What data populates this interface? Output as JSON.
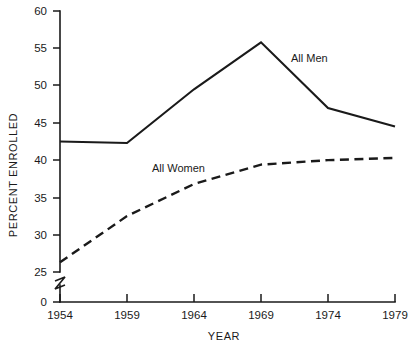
{
  "chart_data": {
    "type": "line",
    "title": "",
    "xlabel": "YEAR",
    "ylabel": "PERCENT ENROLLED",
    "categories": [
      "1954",
      "1959",
      "1964",
      "1969",
      "1974",
      "1979"
    ],
    "x": [
      1954,
      1959,
      1964,
      1969,
      1974,
      1979
    ],
    "xlim": [
      1954,
      1979
    ],
    "ylim": [
      25,
      60
    ],
    "y_axis_break": true,
    "y_axis_break_from": 0,
    "y_axis_break_to": 25,
    "y_ticks": [
      0,
      25,
      30,
      35,
      40,
      45,
      50,
      55,
      60
    ],
    "y_tick_labels": [
      "0",
      "25",
      "30",
      "35",
      "40",
      "45",
      "50",
      "55",
      "60"
    ],
    "x_ticks": [
      1954,
      1959,
      1964,
      1969,
      1974,
      1979
    ],
    "x_tick_labels": [
      "1954",
      "1959",
      "1964",
      "1969",
      "1974",
      "1979"
    ],
    "grid": false,
    "legend_position": "inline-annotations",
    "series": [
      {
        "name": "All Men",
        "style": "solid",
        "label_text": "All Men",
        "values": [
          42.5,
          42.3,
          49.5,
          55.8,
          47.0,
          44.5
        ]
      },
      {
        "name": "All Women",
        "style": "dashed",
        "label_text": "All Women",
        "values": [
          26.3,
          32.5,
          36.8,
          39.4,
          40.0,
          40.3
        ]
      }
    ],
    "annotations": [
      {
        "text": "All Men",
        "x": 1971.4,
        "y": 52.0
      },
      {
        "text": "All Women",
        "x": 1961.8,
        "y": 38.6
      }
    ]
  },
  "colors": {
    "ink": "#1a1a1a",
    "background": "#ffffff"
  }
}
